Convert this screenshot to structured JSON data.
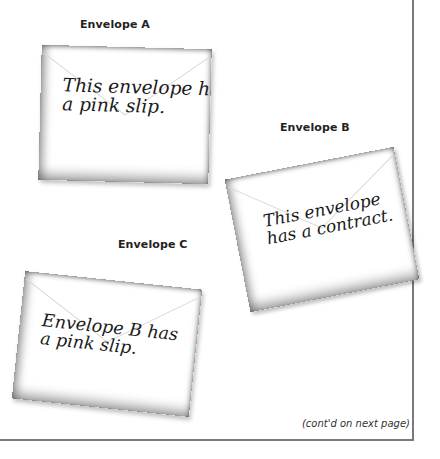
{
  "envelopes": [
    {
      "id": "A",
      "label": "Envelope A",
      "message_line1": "This envelope has",
      "message_line2": "a pink slip."
    },
    {
      "id": "B",
      "label": "Envelope B",
      "message_line1": "This envelope",
      "message_line2": "has a contract."
    },
    {
      "id": "C",
      "label": "Envelope C",
      "message_line1": "Envelope B has",
      "message_line2": "a pink slip."
    }
  ],
  "footer": {
    "note": "(cont'd on next page)"
  },
  "colors": {
    "frame": "#7a7a7a",
    "text": "#1a1a1a",
    "background": "#ffffff"
  }
}
